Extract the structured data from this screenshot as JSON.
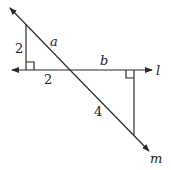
{
  "diagram": {
    "type": "geometry-similar-triangles",
    "lines": {
      "l": {
        "label": "l",
        "direction": "horizontal"
      },
      "m": {
        "label": "m",
        "direction": "diagonal"
      }
    },
    "left_triangle": {
      "vertical_leg": "2",
      "horizontal_leg": "2",
      "hypotenuse": "a",
      "right_angle": true
    },
    "right_triangle": {
      "horizontal_leg": "b",
      "hypotenuse": "4",
      "right_angle": true
    },
    "labels": {
      "left_vertical": "2",
      "left_horizontal": "2",
      "hyp_left": "a",
      "top_right": "b",
      "hyp_right": "4",
      "line_l": "l",
      "line_m": "m"
    }
  }
}
